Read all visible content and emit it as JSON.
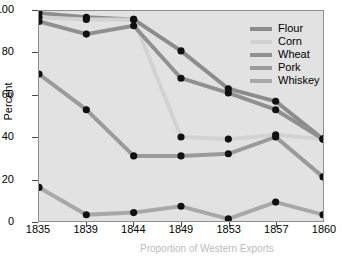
{
  "chart_data": {
    "type": "line",
    "title": "",
    "xlabel": "Proportion of Western Exports",
    "ylabel": "Percent",
    "x": [
      1835,
      1839,
      1844,
      1849,
      1853,
      1857,
      1860
    ],
    "xticklabels": [
      "1835",
      "1839",
      "1844",
      "1849",
      "1853",
      "1857",
      "1860"
    ],
    "yticklabels": [
      "0",
      "20",
      "40",
      "60",
      "80",
      "100"
    ],
    "ylim": [
      0,
      100
    ],
    "xlim": [
      1835,
      1860
    ],
    "grid": false,
    "legend_position": "top-right",
    "series": [
      {
        "name": "Flour",
        "color": "#8c8c8c",
        "values": [
          99,
          97,
          96,
          81,
          63,
          57,
          39
        ]
      },
      {
        "name": "Corn",
        "color": "#d2d2d2",
        "values": [
          97,
          96,
          96,
          40,
          39,
          41,
          39
        ]
      },
      {
        "name": "Wheat",
        "color": "#909090",
        "values": [
          95,
          89,
          93,
          68,
          61,
          53,
          39
        ]
      },
      {
        "name": "Pork",
        "color": "#9a9a9a",
        "values": [
          70,
          53,
          31,
          31,
          32,
          40,
          21
        ]
      },
      {
        "name": "Whiskey",
        "color": "#a8a8a8",
        "values": [
          16,
          3,
          4,
          7,
          1,
          9,
          3
        ]
      }
    ]
  },
  "legend": {
    "items": [
      {
        "label": "Flour"
      },
      {
        "label": "Corn"
      },
      {
        "label": "Wheat"
      },
      {
        "label": "Pork"
      },
      {
        "label": "Whiskey"
      }
    ]
  },
  "axes": {
    "y_title": "Percent",
    "x_title": "Proportion of Western Exports"
  }
}
